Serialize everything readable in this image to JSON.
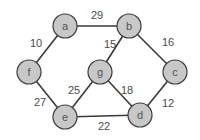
{
  "graph": {
    "type": "weighted-undirected-graph",
    "colors": {
      "node_fill": "#c8c8c8",
      "node_stroke": "#3c3c3c",
      "edge": "#3a3a3a",
      "text": "#4a4a4a"
    },
    "nodes": [
      {
        "id": "a",
        "label": "a",
        "x": 65,
        "y": 26
      },
      {
        "id": "b",
        "label": "b",
        "x": 129,
        "y": 26
      },
      {
        "id": "c",
        "label": "c",
        "x": 175,
        "y": 72
      },
      {
        "id": "d",
        "label": "d",
        "x": 140,
        "y": 115
      },
      {
        "id": "e",
        "label": "e",
        "x": 65,
        "y": 117
      },
      {
        "id": "f",
        "label": "f",
        "x": 29,
        "y": 72
      },
      {
        "id": "g",
        "label": "g",
        "x": 100,
        "y": 72
      }
    ],
    "edges": [
      {
        "from": "a",
        "to": "b",
        "weight": "29",
        "lx": 97,
        "ly": 15
      },
      {
        "from": "a",
        "to": "f",
        "weight": "10",
        "lx": 36,
        "ly": 43
      },
      {
        "from": "b",
        "to": "g",
        "weight": "15",
        "lx": 110,
        "ly": 44
      },
      {
        "from": "b",
        "to": "c",
        "weight": "16",
        "lx": 168,
        "ly": 42
      },
      {
        "from": "f",
        "to": "e",
        "weight": "27",
        "lx": 40,
        "ly": 102
      },
      {
        "from": "g",
        "to": "e",
        "weight": "25",
        "lx": 74,
        "ly": 90
      },
      {
        "from": "g",
        "to": "d",
        "weight": "18",
        "lx": 127,
        "ly": 90
      },
      {
        "from": "c",
        "to": "d",
        "weight": "12",
        "lx": 168,
        "ly": 103
      },
      {
        "from": "e",
        "to": "d",
        "weight": "22",
        "lx": 104,
        "ly": 126
      }
    ]
  }
}
